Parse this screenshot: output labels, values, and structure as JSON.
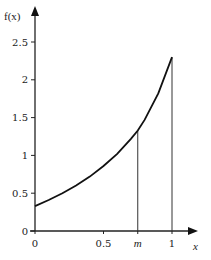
{
  "chart_data": {
    "type": "line",
    "title": "",
    "xlabel": "x",
    "ylabel": "f(x)",
    "xlim": [
      0,
      1.1
    ],
    "ylim": [
      0,
      2.7
    ],
    "grid": false,
    "legend": null,
    "x_ticks": [
      {
        "value": 0,
        "label": "0"
      },
      {
        "value": 0.5,
        "label": "0.5"
      },
      {
        "value": 0.75,
        "label": "m"
      },
      {
        "value": 1,
        "label": "1"
      }
    ],
    "y_ticks": [
      {
        "value": 0,
        "label": "0"
      },
      {
        "value": 0.5,
        "label": "0.5"
      },
      {
        "value": 1,
        "label": "1"
      },
      {
        "value": 1.5,
        "label": "1.5"
      },
      {
        "value": 2,
        "label": "2"
      },
      {
        "value": 2.5,
        "label": "2.5"
      }
    ],
    "series": [
      {
        "name": "f(x)",
        "x": [
          0,
          0.1,
          0.2,
          0.3,
          0.4,
          0.5,
          0.6,
          0.7,
          0.75,
          0.8,
          0.9,
          1.0
        ],
        "values": [
          0.33,
          0.41,
          0.5,
          0.6,
          0.72,
          0.86,
          1.02,
          1.22,
          1.33,
          1.47,
          1.82,
          2.3
        ]
      }
    ],
    "annotations": [
      {
        "type": "vertical-line",
        "x": 0.75,
        "label": "m",
        "from_y": 0,
        "to_y": 1.33
      },
      {
        "type": "vertical-line",
        "x": 1,
        "label": "1",
        "from_y": 0,
        "to_y": 2.3
      }
    ]
  },
  "labels": {
    "y_axis": "f(x)",
    "x_axis": "x"
  }
}
